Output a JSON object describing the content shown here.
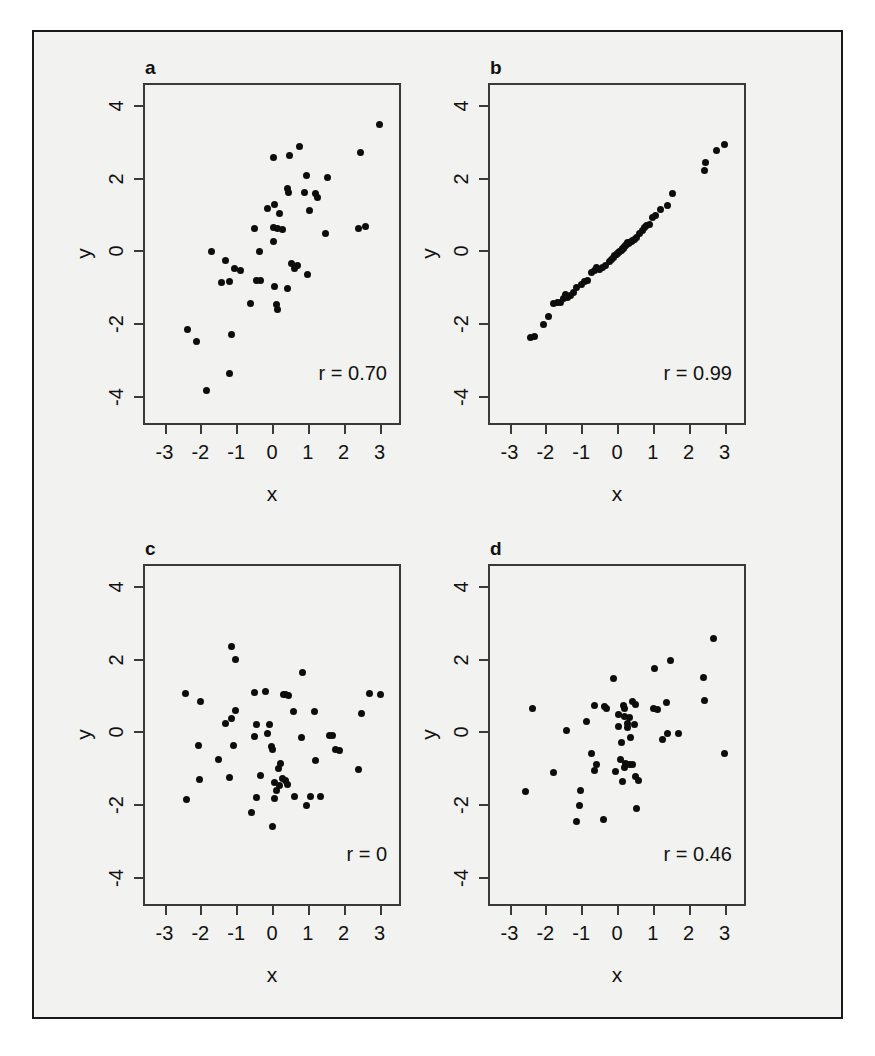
{
  "figure": {
    "background_color": "#f2f2f0",
    "border_color": "#1a1a1a",
    "point_color": "#0d0d0d",
    "axis_color": "#3a3a3a",
    "caption_text": ""
  },
  "chart_data": [
    {
      "type": "scatter",
      "panel": "a",
      "title": "a",
      "annotation": "r = 0.70",
      "correlation": 0.7,
      "xlabel": "x",
      "ylabel": "y",
      "xlim": [
        -3.6,
        3.6
      ],
      "ylim": [
        -4.8,
        4.6
      ],
      "xticks": [
        -3,
        -2,
        -1,
        0,
        1,
        2,
        3
      ],
      "xticklabels": [
        "-3",
        "-2",
        "-1",
        "0",
        "1",
        "2",
        "3"
      ],
      "yticks": [
        4,
        2,
        0,
        -2,
        -4
      ],
      "yticklabels": [
        "4",
        "2",
        "0",
        "-2",
        "-4"
      ],
      "grid": false,
      "legend": "none",
      "points": [
        [
          3.0,
          3.45
        ],
        [
          2.46,
          2.7
        ],
        [
          0.78,
          2.85
        ],
        [
          0.5,
          2.6
        ],
        [
          0.05,
          2.55
        ],
        [
          0.95,
          2.05
        ],
        [
          1.55,
          2.0
        ],
        [
          0.9,
          1.6
        ],
        [
          1.22,
          1.55
        ],
        [
          1.28,
          1.45
        ],
        [
          0.42,
          1.7
        ],
        [
          0.46,
          1.6
        ],
        [
          1.05,
          1.1
        ],
        [
          -0.12,
          1.15
        ],
        [
          0.08,
          1.25
        ],
        [
          0.2,
          1.0
        ],
        [
          -0.5,
          0.6
        ],
        [
          0.05,
          0.62
        ],
        [
          0.15,
          0.6
        ],
        [
          0.3,
          0.58
        ],
        [
          2.4,
          0.6
        ],
        [
          2.6,
          0.65
        ],
        [
          1.5,
          0.45
        ],
        [
          0.05,
          0.25
        ],
        [
          -0.35,
          -0.03
        ],
        [
          -1.7,
          -0.04
        ],
        [
          -1.3,
          -0.28
        ],
        [
          0.55,
          -0.35
        ],
        [
          0.7,
          -0.42
        ],
        [
          0.62,
          -0.5
        ],
        [
          -1.05,
          -0.5
        ],
        [
          -0.88,
          -0.56
        ],
        [
          1.0,
          -0.65
        ],
        [
          -0.42,
          -0.82
        ],
        [
          -0.32,
          -0.83
        ],
        [
          -1.42,
          -0.88
        ],
        [
          -1.18,
          -0.86
        ],
        [
          0.07,
          -1.0
        ],
        [
          0.42,
          -1.05
        ],
        [
          0.12,
          -1.5
        ],
        [
          0.15,
          -1.62
        ],
        [
          -0.6,
          -1.45
        ],
        [
          -2.35,
          -2.18
        ],
        [
          -1.12,
          -2.3
        ],
        [
          -2.12,
          -2.5
        ],
        [
          -1.18,
          -3.38
        ],
        [
          -1.82,
          -3.85
        ]
      ]
    },
    {
      "type": "scatter",
      "panel": "b",
      "title": "b",
      "annotation": "r = 0.99",
      "correlation": 0.99,
      "xlabel": "x",
      "ylabel": "y",
      "xlim": [
        -3.6,
        3.6
      ],
      "ylim": [
        -4.8,
        4.6
      ],
      "xticks": [
        -3,
        -2,
        -1,
        0,
        1,
        2,
        3
      ],
      "xticklabels": [
        "-3",
        "-2",
        "-1",
        "0",
        "1",
        "2",
        "3"
      ],
      "yticks": [
        4,
        2,
        0,
        -2,
        -4
      ],
      "yticklabels": [
        "4",
        "2",
        "0",
        "-2",
        "-4"
      ],
      "grid": false,
      "legend": "none",
      "points": [
        [
          3.0,
          2.9
        ],
        [
          2.78,
          2.75
        ],
        [
          2.46,
          2.42
        ],
        [
          2.44,
          2.2
        ],
        [
          1.55,
          1.55
        ],
        [
          1.4,
          1.22
        ],
        [
          1.2,
          1.12
        ],
        [
          1.08,
          0.95
        ],
        [
          1.0,
          0.9
        ],
        [
          0.92,
          0.72
        ],
        [
          0.82,
          0.68
        ],
        [
          0.78,
          0.62
        ],
        [
          0.72,
          0.55
        ],
        [
          0.62,
          0.45
        ],
        [
          0.55,
          0.35
        ],
        [
          0.5,
          0.3
        ],
        [
          0.44,
          0.28
        ],
        [
          0.4,
          0.25
        ],
        [
          0.36,
          0.22
        ],
        [
          0.32,
          0.18
        ],
        [
          0.3,
          0.22
        ],
        [
          0.26,
          0.15
        ],
        [
          0.24,
          0.12
        ],
        [
          0.2,
          0.1
        ],
        [
          0.18,
          0.06
        ],
        [
          0.15,
          0.05
        ],
        [
          0.12,
          0.0
        ],
        [
          0.08,
          -0.02
        ],
        [
          0.05,
          -0.05
        ],
        [
          0.02,
          -0.08
        ],
        [
          -0.02,
          -0.12
        ],
        [
          -0.06,
          -0.15
        ],
        [
          -0.1,
          -0.2
        ],
        [
          -0.16,
          -0.25
        ],
        [
          -0.22,
          -0.3
        ],
        [
          -0.32,
          -0.42
        ],
        [
          -0.4,
          -0.48
        ],
        [
          -0.48,
          -0.52
        ],
        [
          -0.56,
          -0.48
        ],
        [
          -0.64,
          -0.55
        ],
        [
          -0.72,
          -0.62
        ],
        [
          -0.82,
          -0.82
        ],
        [
          -0.9,
          -0.86
        ],
        [
          -1.0,
          -0.95
        ],
        [
          -1.12,
          -1.02
        ],
        [
          -1.22,
          -1.15
        ],
        [
          -1.3,
          -1.25
        ],
        [
          -1.38,
          -1.3
        ],
        [
          -1.45,
          -1.22
        ],
        [
          -1.5,
          -1.32
        ],
        [
          -1.58,
          -1.42
        ],
        [
          -1.66,
          -1.44
        ],
        [
          -1.78,
          -1.45
        ],
        [
          -1.9,
          -1.82
        ],
        [
          -2.05,
          -2.05
        ],
        [
          -2.3,
          -2.38
        ],
        [
          -2.42,
          -2.4
        ]
      ]
    },
    {
      "type": "scatter",
      "panel": "c",
      "title": "c",
      "annotation": "r = 0",
      "correlation": 0,
      "xlabel": "x",
      "ylabel": "y",
      "xlim": [
        -3.6,
        3.6
      ],
      "ylim": [
        -4.8,
        4.6
      ],
      "xticks": [
        -3,
        -2,
        -1,
        0,
        1,
        2,
        3
      ],
      "xticklabels": [
        "-3",
        "-2",
        "-1",
        "0",
        "1",
        "2",
        "3"
      ],
      "yticks": [
        4,
        2,
        0,
        -2,
        -4
      ],
      "yticklabels": [
        "4",
        "2",
        "0",
        "-2",
        "-4"
      ],
      "grid": false,
      "legend": "none",
      "points": [
        [
          -1.12,
          2.32
        ],
        [
          -1.02,
          1.98
        ],
        [
          0.86,
          1.62
        ],
        [
          -2.42,
          1.05
        ],
        [
          -0.5,
          1.08
        ],
        [
          -0.18,
          1.1
        ],
        [
          0.32,
          1.0
        ],
        [
          0.38,
          1.02
        ],
        [
          0.46,
          0.98
        ],
        [
          2.72,
          1.05
        ],
        [
          3.02,
          1.02
        ],
        [
          -2.0,
          0.82
        ],
        [
          -1.02,
          0.58
        ],
        [
          0.6,
          0.55
        ],
        [
          1.18,
          0.55
        ],
        [
          2.5,
          0.48
        ],
        [
          -1.3,
          0.22
        ],
        [
          -1.12,
          0.35
        ],
        [
          -0.42,
          0.18
        ],
        [
          -0.08,
          0.2
        ],
        [
          -0.12,
          -0.05
        ],
        [
          -0.5,
          -0.14
        ],
        [
          1.6,
          -0.1
        ],
        [
          1.68,
          -0.12
        ],
        [
          0.82,
          -0.18
        ],
        [
          -2.05,
          -0.38
        ],
        [
          -1.08,
          -0.38
        ],
        [
          -0.02,
          -0.42
        ],
        [
          0.0,
          -0.5
        ],
        [
          1.78,
          -0.5
        ],
        [
          1.88,
          -0.52
        ],
        [
          -1.48,
          -0.78
        ],
        [
          1.2,
          -0.8
        ],
        [
          0.25,
          -0.88
        ],
        [
          0.18,
          -1.02
        ],
        [
          -0.32,
          -1.22
        ],
        [
          2.42,
          -1.05
        ],
        [
          -1.18,
          -1.28
        ],
        [
          0.3,
          -1.3
        ],
        [
          0.38,
          -1.35
        ],
        [
          0.08,
          -1.4
        ],
        [
          0.42,
          -1.45
        ],
        [
          0.22,
          -1.5
        ],
        [
          -2.02,
          -1.32
        ],
        [
          0.12,
          -1.62
        ],
        [
          0.62,
          -1.78
        ],
        [
          1.08,
          -1.78
        ],
        [
          0.08,
          -1.85
        ],
        [
          -0.42,
          -1.82
        ],
        [
          1.35,
          -1.78
        ],
        [
          -2.4,
          -1.88
        ],
        [
          0.95,
          -2.05
        ],
        [
          -0.58,
          -2.22
        ],
        [
          0.0,
          -2.62
        ]
      ]
    },
    {
      "type": "scatter",
      "panel": "d",
      "title": "d",
      "annotation": "r = 0.46",
      "correlation": 0.46,
      "xlabel": "x",
      "ylabel": "y",
      "xlim": [
        -3.6,
        3.6
      ],
      "ylim": [
        -4.8,
        4.6
      ],
      "xticks": [
        -3,
        -2,
        -1,
        0,
        1,
        2,
        3
      ],
      "xticklabels": [
        "-3",
        "-2",
        "-1",
        "0",
        "1",
        "2",
        "3"
      ],
      "yticks": [
        4,
        2,
        0,
        -2,
        -4
      ],
      "yticklabels": [
        "4",
        "2",
        "0",
        "-2",
        "-4"
      ],
      "grid": false,
      "legend": "none",
      "points": [
        [
          2.68,
          2.55
        ],
        [
          1.5,
          1.95
        ],
        [
          1.05,
          1.72
        ],
        [
          2.42,
          1.48
        ],
        [
          -0.1,
          1.45
        ],
        [
          2.45,
          0.85
        ],
        [
          1.38,
          0.78
        ],
        [
          0.42,
          0.82
        ],
        [
          0.52,
          0.75
        ],
        [
          0.18,
          0.72
        ],
        [
          0.2,
          0.62
        ],
        [
          -0.62,
          0.72
        ],
        [
          -0.35,
          0.68
        ],
        [
          -0.28,
          0.62
        ],
        [
          -2.35,
          0.62
        ],
        [
          1.02,
          0.62
        ],
        [
          1.12,
          0.6
        ],
        [
          0.05,
          0.45
        ],
        [
          0.22,
          0.42
        ],
        [
          0.35,
          0.38
        ],
        [
          -0.85,
          0.28
        ],
        [
          0.3,
          0.22
        ],
        [
          0.48,
          0.2
        ],
        [
          0.05,
          0.12
        ],
        [
          0.28,
          0.1
        ],
        [
          -1.42,
          0.02
        ],
        [
          1.42,
          -0.05
        ],
        [
          1.72,
          -0.05
        ],
        [
          0.38,
          -0.18
        ],
        [
          1.28,
          -0.22
        ],
        [
          0.12,
          -0.3
        ],
        [
          -0.72,
          -0.6
        ],
        [
          0.1,
          -0.78
        ],
        [
          0.25,
          -0.88
        ],
        [
          0.35,
          -0.9
        ],
        [
          0.42,
          -0.92
        ],
        [
          -0.58,
          -0.9
        ],
        [
          0.2,
          -0.98
        ],
        [
          3.0,
          -0.62
        ],
        [
          -1.78,
          -1.12
        ],
        [
          -0.05,
          -1.1
        ],
        [
          -0.62,
          -1.08
        ],
        [
          0.52,
          -1.25
        ],
        [
          0.15,
          -1.38
        ],
        [
          0.6,
          -1.35
        ],
        [
          -2.55,
          -1.65
        ],
        [
          -1.02,
          -1.62
        ],
        [
          -1.05,
          -2.05
        ],
        [
          0.55,
          -2.12
        ],
        [
          -1.12,
          -2.48
        ],
        [
          -0.38,
          -2.42
        ]
      ]
    }
  ]
}
